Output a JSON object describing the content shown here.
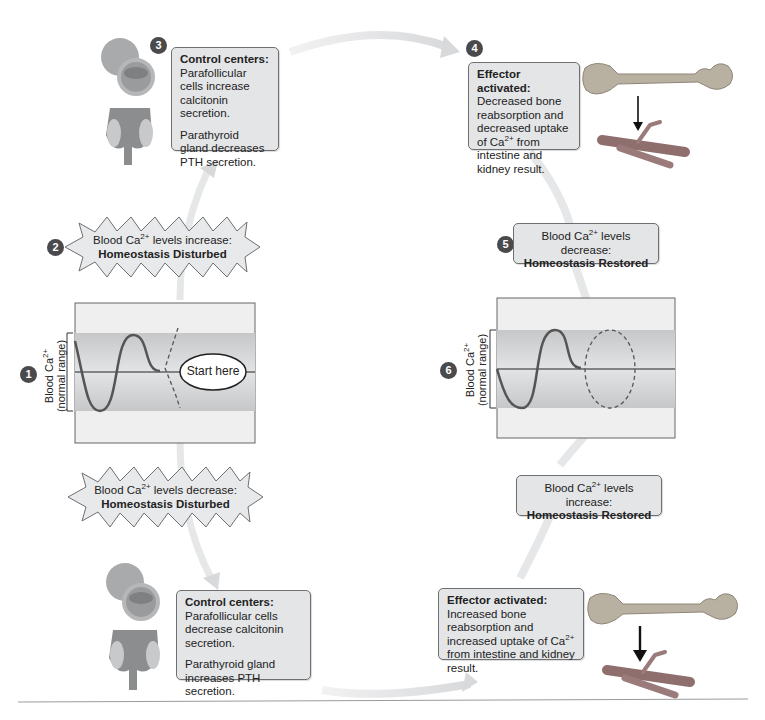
{
  "diagram": {
    "topic": "Calcium homeostasis negative feedback",
    "steps": [
      {
        "number": "1",
        "label": "Blood Ca2+ (normal range)",
        "ylabel_line1": "Blood Ca",
        "ylabel_sup": "2+",
        "ylabel_line2": "(normal range)",
        "start_label": "Start here"
      },
      {
        "number": "2",
        "line1_pre": "Blood Ca",
        "line1_sup": "2+",
        "line1_post": " levels increase:",
        "line2": "Homeostasis Disturbed"
      },
      {
        "number": "3",
        "title": "Control centers:",
        "para1": "Parafollicular cells increase calcitonin secretion.",
        "para2": "Parathyroid gland decreases PTH secretion."
      },
      {
        "number": "4",
        "title": "Effector activated:",
        "body_pre": "Decreased bone reabsorption and decreased uptake of Ca",
        "body_sup": "2+",
        "body_post": " from intestine and kidney result."
      },
      {
        "number": "5",
        "line1_pre": "Blood Ca",
        "line1_sup": "2+",
        "line1_post": " levels decrease:",
        "line2": "Homeostasis Restored"
      },
      {
        "number": "6",
        "ylabel_line1": "Blood Ca",
        "ylabel_sup": "2+",
        "ylabel_line2": "(normal range)"
      }
    ],
    "lower_loop": {
      "disturbed": {
        "line1_pre": "Blood Ca",
        "line1_sup": "2+",
        "line1_post": " levels decrease:",
        "line2": "Homeostasis Disturbed"
      },
      "control": {
        "title": "Control centers:",
        "para1": "Parafollicular cells decrease calcitonin secretion.",
        "para2": "Parathyroid gland increases PTH secretion."
      },
      "effector": {
        "title": "Effector activated:",
        "body_pre": "Increased bone reabsorption and increased uptake of Ca",
        "body_sup": "2+",
        "body_post": " from intestine and kidney result."
      },
      "restored": {
        "line1_pre": "Blood Ca",
        "line1_sup": "2+",
        "line1_post": " levels increase:",
        "line2": "Homeostasis Restored"
      }
    },
    "colors": {
      "box_fill": "#e4e5e7",
      "box_border": "#6e6f72",
      "arrow": "#dfe0e2",
      "badge": "#4a4a4c",
      "band": "#c9cacc",
      "graph_bg": "#efefef",
      "curve": "#555555"
    }
  }
}
